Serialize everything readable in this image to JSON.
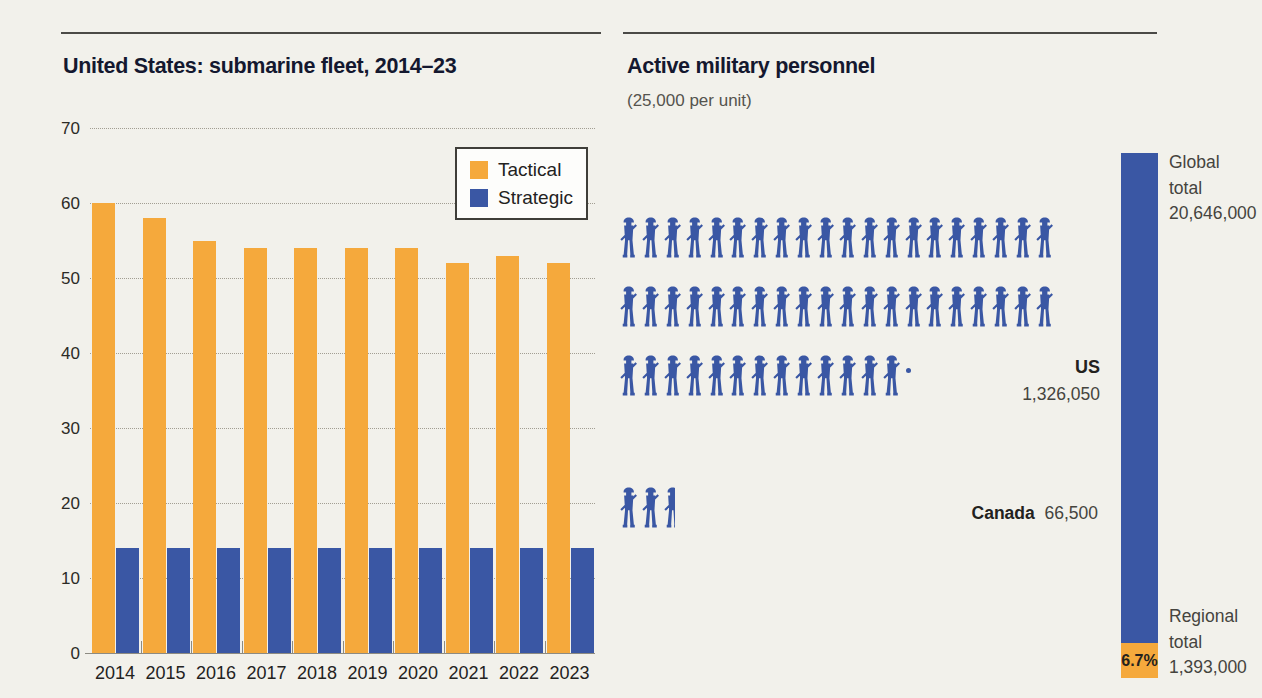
{
  "colors": {
    "background": "#f2f1eb",
    "tactical": "#f5a93c",
    "strategic": "#3a57a4",
    "soldier": "#3a57a4",
    "rule": "#4b4a46"
  },
  "chart_data": [
    {
      "type": "bar",
      "title": "United States: submarine fleet, 2014–23",
      "categories": [
        "2014",
        "2015",
        "2016",
        "2017",
        "2018",
        "2019",
        "2020",
        "2021",
        "2022",
        "2023"
      ],
      "series": [
        {
          "name": "Tactical",
          "color": "#f5a93c",
          "values": [
            60,
            58,
            55,
            54,
            54,
            54,
            54,
            52,
            53,
            52
          ]
        },
        {
          "name": "Strategic",
          "color": "#3a57a4",
          "values": [
            14,
            14,
            14,
            14,
            14,
            14,
            14,
            14,
            14,
            14
          ]
        }
      ],
      "xlabel": "",
      "ylabel": "",
      "ylim": [
        0,
        70
      ],
      "ytick_step": 10,
      "grid": true,
      "legend_position": "top-right"
    },
    {
      "type": "pictogram",
      "title": "Active military personnel",
      "subtitle": "(25,000 per unit)",
      "unit_value": 25000,
      "unit_icon": "soldier-icon",
      "items": [
        {
          "label": "US",
          "value": 1326050,
          "value_label": "1,326,050",
          "units": 53.04,
          "rows": [
            20,
            20,
            13
          ],
          "fraction_dot": true
        },
        {
          "label": "Canada",
          "value": 66500,
          "value_label": "66,500",
          "units": 2.66,
          "rows": [
            2
          ],
          "partial_last": 0.62
        }
      ],
      "totals": {
        "global": {
          "lines": [
            "Global",
            "total",
            "20,646,000"
          ],
          "value": 20646000,
          "color": "#3a57a4"
        },
        "regional": {
          "lines": [
            "Regional",
            "total",
            "1,393,000"
          ],
          "value": 1393000,
          "color": "#f5a93c",
          "pct_label": "6.7%",
          "pct_of_global": 6.7
        }
      }
    }
  ]
}
